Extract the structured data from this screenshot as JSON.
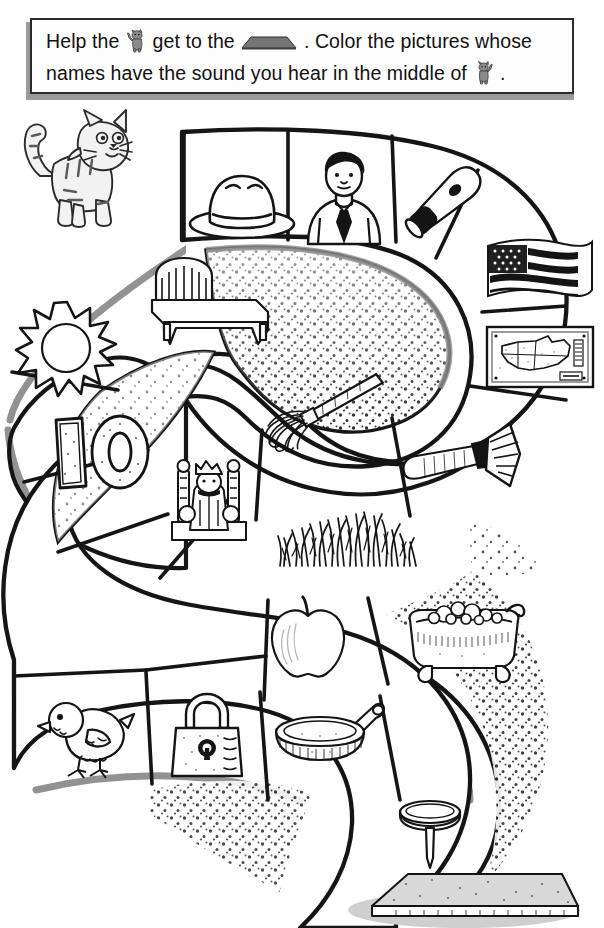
{
  "worksheet": {
    "title": "Short A Sound Maze",
    "instruction_line1": "Help the  get to the  . Color the pictures whose",
    "instruction_line2": "names have the sound you hear in the middle of  .",
    "instruction_full": "Help the [cat] get to the [mat]. Color the pictures whose names have the sound you hear in the middle of [cat].",
    "text_segments": {
      "s1": "Help the",
      "s2": "get to the",
      "s3": ". Color the pictures whose",
      "s4": "names have the sound you hear in the middle of",
      "s5": "."
    },
    "start_label": "cat",
    "goal_label": "mat",
    "target_sound": "short a"
  },
  "colors": {
    "ink": "#1a1a1a",
    "paper": "#ffffff",
    "banner_fill": "#fdfdfd",
    "banner_border": "#2b2b2b",
    "banner_shadow": "#9a9a9a",
    "path_shadow": "#8d8d8d",
    "stipple": "#2a2a2a"
  },
  "start_marker": {
    "name": "cat",
    "icon": "cat-icon"
  },
  "goal_marker": {
    "name": "mat",
    "icon": "mat-icon"
  },
  "maze": {
    "path_shape": "S-curve",
    "cell_count": 17,
    "cells": [
      {
        "index": 1,
        "name": "hat",
        "icon": "hat-icon",
        "x": 186,
        "y": 42,
        "w": 104,
        "h": 92,
        "match": true
      },
      {
        "index": 2,
        "name": "man",
        "icon": "man-icon",
        "x": 292,
        "y": 38,
        "w": 98,
        "h": 96,
        "match": true
      },
      {
        "index": 3,
        "name": "bat",
        "icon": "bat-icon",
        "x": 392,
        "y": 36,
        "w": 106,
        "h": 100,
        "match": true
      },
      {
        "index": 4,
        "name": "flag",
        "icon": "flag-icon",
        "x": 480,
        "y": 126,
        "w": 120,
        "h": 86,
        "match": true
      },
      {
        "index": 5,
        "name": "map",
        "icon": "map-icon",
        "x": 480,
        "y": 218,
        "w": 120,
        "h": 84,
        "match": true
      },
      {
        "index": 6,
        "name": "sun",
        "icon": "sun-icon",
        "x": 14,
        "y": 198,
        "w": 104,
        "h": 104,
        "match": false
      },
      {
        "index": 7,
        "name": "bed",
        "icon": "bed-icon",
        "x": 140,
        "y": 152,
        "w": 136,
        "h": 96,
        "match": false
      },
      {
        "index": 8,
        "name": "mop",
        "icon": "mop-icon",
        "x": 256,
        "y": 272,
        "w": 136,
        "h": 72,
        "match": false
      },
      {
        "index": 9,
        "name": "axe",
        "icon": "axe-icon",
        "x": 396,
        "y": 320,
        "w": 128,
        "h": 88,
        "match": true
      },
      {
        "index": 10,
        "name": "ten",
        "icon": "ten-icon",
        "x": 48,
        "y": 312,
        "w": 110,
        "h": 86,
        "match": false
      },
      {
        "index": 11,
        "name": "king",
        "icon": "king-icon",
        "x": 162,
        "y": 358,
        "w": 96,
        "h": 92,
        "match": false
      },
      {
        "index": 12,
        "name": "grass",
        "icon": "grass-icon",
        "x": 270,
        "y": 400,
        "w": 150,
        "h": 80,
        "match": true
      },
      {
        "index": 13,
        "name": "apple",
        "icon": "apple-icon",
        "x": 256,
        "y": 496,
        "w": 102,
        "h": 92,
        "match": false
      },
      {
        "index": 14,
        "name": "bathtub",
        "icon": "bathtub-icon",
        "x": 396,
        "y": 500,
        "w": 134,
        "h": 90,
        "match": true
      },
      {
        "index": 15,
        "name": "chick",
        "icon": "chick-icon",
        "x": 36,
        "y": 592,
        "w": 104,
        "h": 94,
        "match": false
      },
      {
        "index": 16,
        "name": "lock",
        "icon": "lock-icon",
        "x": 158,
        "y": 592,
        "w": 96,
        "h": 96,
        "match": false
      },
      {
        "index": 17,
        "name": "pan",
        "icon": "pan-icon",
        "x": 272,
        "y": 600,
        "w": 118,
        "h": 82,
        "match": true
      },
      {
        "index": 18,
        "name": "nail",
        "icon": "nail-icon",
        "x": 388,
        "y": 688,
        "w": 88,
        "h": 92,
        "match": false
      }
    ]
  }
}
